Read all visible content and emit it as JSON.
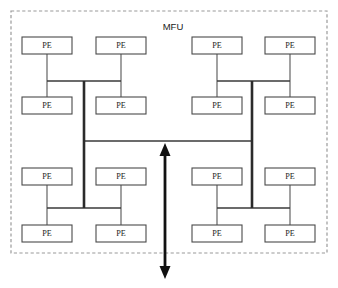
{
  "diagram": {
    "title": "MFU",
    "boundary": {
      "label": "MFU",
      "label_x": 173,
      "label_y": 27,
      "x": 11,
      "y": 11,
      "width": 316,
      "height": 242,
      "style": "dashed",
      "color": "#9a9a9a"
    },
    "node_label": "PE",
    "node_color": "#ffffff",
    "node_stroke": "#4a4a4a",
    "link_color": "#3a3a3a",
    "arrow_color": "#111111",
    "node_width": 50,
    "node_height": 17,
    "nodes": [
      {
        "id": "pe-r1c1",
        "label": "PE",
        "x": 22,
        "y": 37,
        "row": 1,
        "col": 1,
        "quadrant": "top-left"
      },
      {
        "id": "pe-r1c2",
        "label": "PE",
        "x": 96,
        "y": 37,
        "row": 1,
        "col": 2,
        "quadrant": "top-left"
      },
      {
        "id": "pe-r1c3",
        "label": "PE",
        "x": 192,
        "y": 37,
        "row": 1,
        "col": 3,
        "quadrant": "top-right"
      },
      {
        "id": "pe-r1c4",
        "label": "PE",
        "x": 265,
        "y": 37,
        "row": 1,
        "col": 4,
        "quadrant": "top-right"
      },
      {
        "id": "pe-r2c1",
        "label": "PE",
        "x": 22,
        "y": 97,
        "row": 2,
        "col": 1,
        "quadrant": "top-left"
      },
      {
        "id": "pe-r2c2",
        "label": "PE",
        "x": 96,
        "y": 97,
        "row": 2,
        "col": 2,
        "quadrant": "top-left"
      },
      {
        "id": "pe-r2c3",
        "label": "PE",
        "x": 192,
        "y": 97,
        "row": 2,
        "col": 3,
        "quadrant": "top-right"
      },
      {
        "id": "pe-r2c4",
        "label": "PE",
        "x": 265,
        "y": 97,
        "row": 2,
        "col": 4,
        "quadrant": "top-right"
      },
      {
        "id": "pe-r3c1",
        "label": "PE",
        "x": 22,
        "y": 168,
        "row": 3,
        "col": 1,
        "quadrant": "bottom-left"
      },
      {
        "id": "pe-r3c2",
        "label": "PE",
        "x": 96,
        "y": 168,
        "row": 3,
        "col": 2,
        "quadrant": "bottom-left"
      },
      {
        "id": "pe-r3c3",
        "label": "PE",
        "x": 192,
        "y": 168,
        "row": 3,
        "col": 3,
        "quadrant": "bottom-right"
      },
      {
        "id": "pe-r3c4",
        "label": "PE",
        "x": 265,
        "y": 168,
        "row": 3,
        "col": 4,
        "quadrant": "bottom-right"
      },
      {
        "id": "pe-r4c1",
        "label": "PE",
        "x": 22,
        "y": 225,
        "row": 4,
        "col": 1,
        "quadrant": "bottom-left"
      },
      {
        "id": "pe-r4c2",
        "label": "PE",
        "x": 96,
        "y": 225,
        "row": 4,
        "col": 2,
        "quadrant": "bottom-left"
      },
      {
        "id": "pe-r4c3",
        "label": "PE",
        "x": 192,
        "y": 225,
        "row": 4,
        "col": 3,
        "quadrant": "bottom-right"
      },
      {
        "id": "pe-r4c4",
        "label": "PE",
        "x": 265,
        "y": 225,
        "row": 4,
        "col": 4,
        "quadrant": "bottom-right"
      }
    ],
    "buses": [
      {
        "id": "bus-top-left",
        "x1": 47,
        "y1": 81,
        "x2": 121,
        "y2": 81
      },
      {
        "id": "bus-top-right",
        "x1": 217,
        "y1": 81,
        "x2": 290,
        "y2": 81
      },
      {
        "id": "bus-bottom-left",
        "x1": 47,
        "y1": 208,
        "x2": 121,
        "y2": 208
      },
      {
        "id": "bus-bottom-right",
        "x1": 217,
        "y1": 208,
        "x2": 290,
        "y2": 208
      },
      {
        "id": "bus-center",
        "x1": 84,
        "y1": 141,
        "x2": 252,
        "y2": 141
      }
    ],
    "trunks": [
      {
        "id": "trunk-left",
        "x1": 84,
        "y1": 81,
        "x2": 84,
        "y2": 208
      },
      {
        "id": "trunk-right",
        "x1": 252,
        "y1": 81,
        "x2": 252,
        "y2": 208
      }
    ],
    "stubs": [
      {
        "id": "stub-r1c1",
        "x1": 47,
        "y1": 54,
        "x2": 47,
        "y2": 81
      },
      {
        "id": "stub-r1c2",
        "x1": 121,
        "y1": 54,
        "x2": 121,
        "y2": 81
      },
      {
        "id": "stub-r1c3",
        "x1": 217,
        "y1": 54,
        "x2": 217,
        "y2": 81
      },
      {
        "id": "stub-r1c4",
        "x1": 290,
        "y1": 54,
        "x2": 290,
        "y2": 81
      },
      {
        "id": "stub-r2c1",
        "x1": 47,
        "y1": 81,
        "x2": 47,
        "y2": 97
      },
      {
        "id": "stub-r2c2",
        "x1": 121,
        "y1": 81,
        "x2": 121,
        "y2": 97
      },
      {
        "id": "stub-r2c3",
        "x1": 217,
        "y1": 81,
        "x2": 217,
        "y2": 97
      },
      {
        "id": "stub-r2c4",
        "x1": 290,
        "y1": 81,
        "x2": 290,
        "y2": 97
      },
      {
        "id": "stub-r3c1",
        "x1": 47,
        "y1": 185,
        "x2": 47,
        "y2": 208
      },
      {
        "id": "stub-r3c2",
        "x1": 121,
        "y1": 185,
        "x2": 121,
        "y2": 208
      },
      {
        "id": "stub-r3c3",
        "x1": 217,
        "y1": 185,
        "x2": 217,
        "y2": 208
      },
      {
        "id": "stub-r3c4",
        "x1": 290,
        "y1": 185,
        "x2": 290,
        "y2": 208
      },
      {
        "id": "stub-r4c1",
        "x1": 47,
        "y1": 208,
        "x2": 47,
        "y2": 225
      },
      {
        "id": "stub-r4c2",
        "x1": 121,
        "y1": 208,
        "x2": 121,
        "y2": 225
      },
      {
        "id": "stub-r4c3",
        "x1": 217,
        "y1": 208,
        "x2": 217,
        "y2": 225
      },
      {
        "id": "stub-r4c4",
        "x1": 290,
        "y1": 208,
        "x2": 290,
        "y2": 225
      }
    ],
    "io_arrow": {
      "id": "io-arrow",
      "x": 165,
      "y_top": 143,
      "y_bottom": 279,
      "direction": "bidirectional",
      "head_width": 11,
      "head_length": 13
    }
  }
}
